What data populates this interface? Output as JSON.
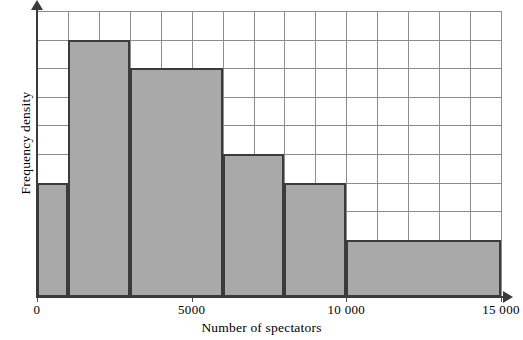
{
  "chart_data": {
    "type": "bar",
    "title": "",
    "subtitle": "",
    "xlabel": "Number of spectators",
    "ylabel": "Frequency density",
    "xlim": [
      0,
      15000
    ],
    "ylim": [
      0,
      10
    ],
    "grid": true,
    "legend": null,
    "x_tick_labels": [
      "0",
      "5000",
      "10 000",
      "15 000"
    ],
    "x_tick_values": [
      0,
      5000,
      10000,
      15000
    ],
    "y_tick_labels": [],
    "x_gridline_step": 1000,
    "y_gridline_step": 1,
    "bar_fill_color": "#a9a9a9",
    "bar_edge_color": "#3b3b3b",
    "grid_color": "#8d8d8d",
    "axis_color": "#3a3a3a",
    "bins": [
      {
        "label": "0-1000",
        "x_start": 0,
        "x_end": 1000,
        "frequency_density": 4.0
      },
      {
        "label": "1000-3000",
        "x_start": 1000,
        "x_end": 3000,
        "frequency_density": 9.0
      },
      {
        "label": "3000-6000",
        "x_start": 3000,
        "x_end": 6000,
        "frequency_density": 8.0
      },
      {
        "label": "6000-8000",
        "x_start": 6000,
        "x_end": 8000,
        "frequency_density": 5.0
      },
      {
        "label": "8000-10000",
        "x_start": 8000,
        "x_end": 10000,
        "frequency_density": 4.0
      },
      {
        "label": "10000-15000",
        "x_start": 10000,
        "x_end": 15000,
        "frequency_density": 2.0
      }
    ]
  },
  "axis_titles": {
    "x": "Number of spectators",
    "y": "Frequency density"
  }
}
